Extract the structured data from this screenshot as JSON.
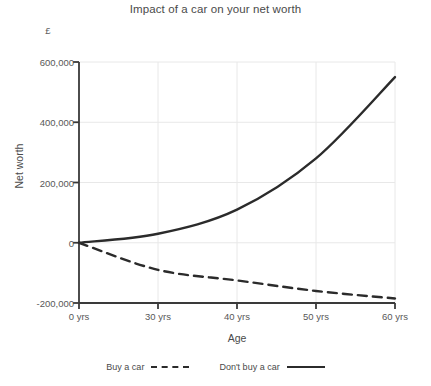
{
  "chart_data": {
    "type": "line",
    "title": "Impact of a car on your net worth",
    "xlabel": "Age",
    "ylabel": "Net worth",
    "unit_label": "£",
    "categories": [
      "0 yrs",
      "30 yrs",
      "40 yrs",
      "50 yrs",
      "60 yrs"
    ],
    "x": [
      0,
      30,
      40,
      50,
      60
    ],
    "x_axis_spacing": "even",
    "ylim": [
      -200000,
      600000
    ],
    "y_ticks": [
      600000,
      400000,
      200000,
      0,
      -200000
    ],
    "y_tick_labels": [
      "600,000",
      "400,000",
      "200,000",
      "0",
      "-200,000"
    ],
    "grid": true,
    "legend_position": "bottom",
    "series": [
      {
        "name": "Buy a car",
        "style": "dashed",
        "color": "#2b2b2b",
        "values": [
          0,
          -90000,
          -125000,
          -160000,
          -185000
        ]
      },
      {
        "name": "Don't buy a car",
        "style": "solid",
        "color": "#2b2b2b",
        "values": [
          0,
          30000,
          110000,
          280000,
          550000
        ]
      }
    ]
  },
  "colors": {
    "axis": "#3a3a3a",
    "grid": "#e8e8e8",
    "line": "#2b2b2b",
    "text": "#4a4a4a"
  }
}
